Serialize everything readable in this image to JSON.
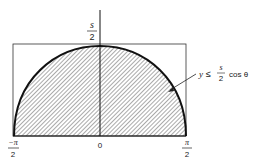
{
  "figure": {
    "y_axis_label": {
      "num": "s",
      "den": "2"
    },
    "x_ticks": [
      {
        "num": "−π",
        "den": "2"
      },
      {
        "value": "0"
      },
      {
        "num": "π",
        "den": "2"
      }
    ],
    "region_label": {
      "lhs": "y",
      "op": "≤",
      "frac_num": "s",
      "frac_den": "2",
      "rhs": "cos θ"
    },
    "colors": {
      "stroke": "#222222",
      "hatch": "#444444",
      "background": "#ffffff"
    }
  }
}
